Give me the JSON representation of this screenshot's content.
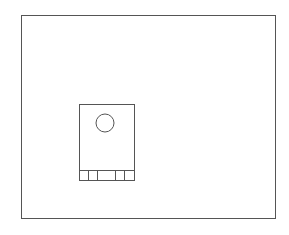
{
  "diagram": {
    "background": "#ffffff",
    "stroke_color": "#555555",
    "outer_frame": {
      "x": 21,
      "y": 15,
      "width": 254,
      "height": 203
    },
    "component_body": {
      "x": 79,
      "y": 104,
      "width": 55,
      "height": 76
    },
    "mounting_hole": {
      "cx": 105,
      "cy": 123,
      "r": 9
    },
    "bottom_strip": {
      "x": 79,
      "y": 170,
      "width": 55,
      "height": 10
    },
    "strip_dividers_x": [
      88,
      97,
      115,
      124
    ]
  }
}
